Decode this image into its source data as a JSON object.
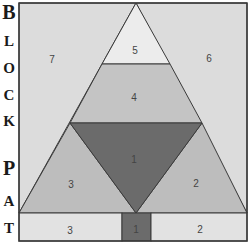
{
  "title_letters": [
    {
      "letter": "B",
      "y": 2,
      "big": true
    },
    {
      "letter": "L",
      "y": 34,
      "big": false
    },
    {
      "letter": "O",
      "y": 61,
      "big": false
    },
    {
      "letter": "C",
      "y": 88,
      "big": false
    },
    {
      "letter": "K",
      "y": 114,
      "big": false
    },
    {
      "letter": "P",
      "y": 160,
      "big": true
    },
    {
      "letter": "A",
      "y": 194,
      "big": false
    },
    {
      "letter": "T",
      "y": 221,
      "big": false
    }
  ],
  "colors": {
    "border": "#3a3a3a",
    "piece_1": "#6b6b6b",
    "piece_2": "#bdbdbd",
    "piece_3": "#bdbdbd",
    "piece_4": "#c4c4c4",
    "piece_5": "#ececec",
    "piece_6": "#dcdcdc",
    "piece_7": "#dcdcdc",
    "strip_side": "#e2e2e2"
  },
  "pieces": {
    "p7": {
      "label": "7"
    },
    "p6": {
      "label": "6"
    },
    "p5": {
      "label": "5"
    },
    "p4": {
      "label": "4"
    },
    "p1": {
      "label": "1"
    },
    "p3": {
      "label": "3"
    },
    "p2": {
      "label": "2"
    },
    "strip_left": {
      "label": "3"
    },
    "strip_center": {
      "label": "1"
    },
    "strip_right": {
      "label": "2"
    }
  }
}
